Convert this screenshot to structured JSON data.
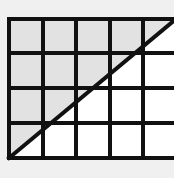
{
  "figure": {
    "type": "geometry-grid-diagram",
    "canvas": {
      "width": 174,
      "height": 178,
      "background_color": "#f0f0f0"
    },
    "colors": {
      "background": "#f0f0f0",
      "grid_line": "#111111",
      "diagonal_line": "#111111",
      "shaded_fill": "#e2e2e2",
      "unshaded_fill": "#ffffff"
    },
    "grid": {
      "columns": 5,
      "rows": 4,
      "line_width": 4,
      "left": 9,
      "top": 19,
      "right": 176,
      "bottom": 158,
      "vertical_line_x": [
        9,
        43,
        76,
        110,
        143,
        176
      ],
      "horizontal_line_y": [
        19,
        53,
        88,
        123,
        158
      ],
      "cell_width": 33.4,
      "cell_height": 34.75
    },
    "diagonal": {
      "line_width": 4,
      "start_x": 9,
      "start_y": 158,
      "end_x": 176,
      "end_y": 19,
      "description": "straight line from bottom-left corner to top-right corner"
    },
    "shading": {
      "region": "above-left of diagonal",
      "fill": "#e2e2e2",
      "polygon_points": "9,19 176,19 9,158",
      "area_fraction": "1/2"
    }
  }
}
